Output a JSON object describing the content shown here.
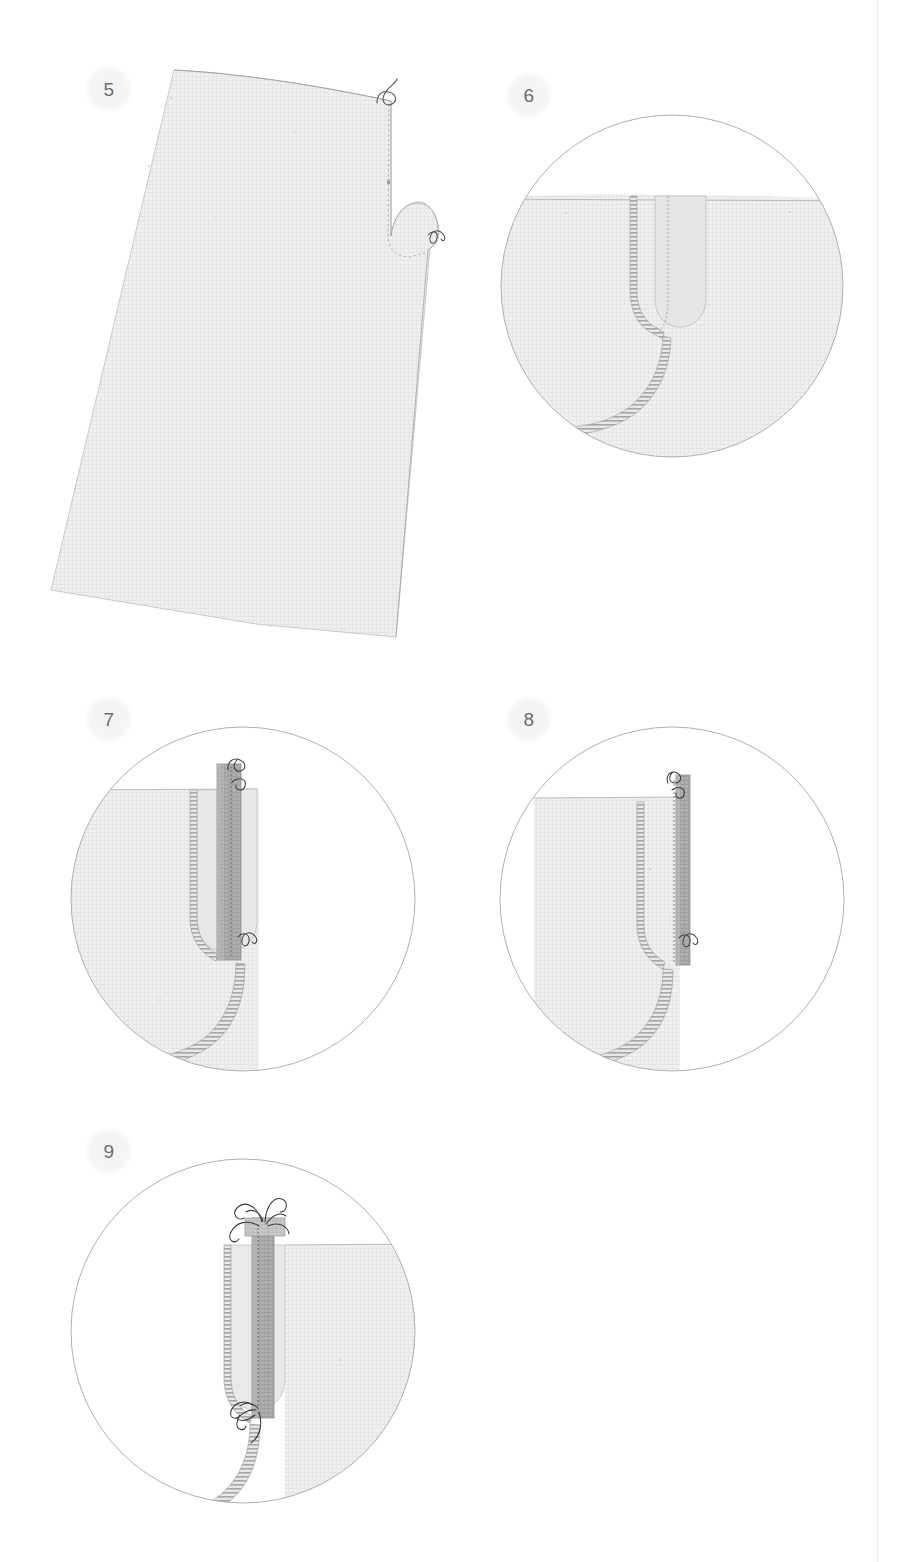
{
  "document": {
    "type": "sewing-pattern-instruction-sheet",
    "subject": "zipper placket / fly construction steps",
    "background_color": "#ffffff"
  },
  "colors": {
    "fabric_fill": "#efefef",
    "fabric_line": "#c9c9c9",
    "fabric_weave": "#e2e2e2",
    "placket_fill": "#a9a9a9",
    "placket_fill_light": "#c4c4c4",
    "circle_stroke": "#b0b0b0",
    "stitch_stroke": "#9a9a9a",
    "thread_stroke": "#4a4a4a",
    "badge_text": "#6d6d6d",
    "badge_bg": "#f3f3f3",
    "spine_rule": "#ededed"
  },
  "steps": [
    {
      "number": "5",
      "badge_label": "5",
      "view": "full-pattern-piece",
      "description": "Full trouser front panel shown flat with finished fly edge and thread tails at top and at the curve.",
      "badge": {
        "x": 86,
        "y": 66
      },
      "details": [
        "thread-tail-top",
        "thread-tail-curve",
        "basting-stitch-line",
        "notch-mark"
      ]
    },
    {
      "number": "6",
      "badge_label": "6",
      "view": "detail-circle",
      "description": "Close-up of fly extension basted closed; serged edge visible along the fly facing.",
      "badge": {
        "x": 506,
        "y": 72
      },
      "circle": {
        "cx": 672,
        "cy": 286,
        "r": 171
      },
      "details": [
        "serged-edge",
        "basting-line",
        "fly-extension"
      ]
    },
    {
      "number": "7",
      "badge_label": "7",
      "view": "detail-circle",
      "description": "Fly facing folded back revealing the placket strip with stitch line; thread tails at top and bottom.",
      "badge": {
        "x": 86,
        "y": 696
      },
      "circle": {
        "cx": 243,
        "cy": 899,
        "r": 172
      },
      "details": [
        "placket-strip",
        "serged-edge",
        "stitch-line",
        "thread-tail-top",
        "thread-tail-bottom"
      ]
    },
    {
      "number": "8",
      "badge_label": "8",
      "view": "detail-circle",
      "description": "Placket strip pressed toward the seam; topstitching secured with thread tails at both ends.",
      "badge": {
        "x": 506,
        "y": 696
      },
      "circle": {
        "cx": 672,
        "cy": 899,
        "r": 172
      },
      "details": [
        "placket-strip",
        "serged-edge",
        "topstitch-line",
        "thread-tail-top",
        "thread-tail-bottom"
      ]
    },
    {
      "number": "9",
      "badge_label": "9",
      "view": "detail-circle",
      "description": "Mirrored view of the finished fly with bar-tack thread bundles at the top and the bottom of the placket.",
      "badge": {
        "x": 86,
        "y": 1128
      },
      "circle": {
        "cx": 243,
        "cy": 1331,
        "r": 172
      },
      "details": [
        "placket-strip",
        "serged-edge",
        "stitch-line",
        "thread-bundle-top",
        "thread-bundle-bottom"
      ]
    }
  ]
}
